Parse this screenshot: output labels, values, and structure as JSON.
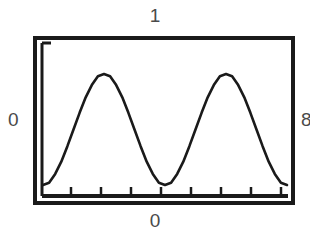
{
  "figure": {
    "name": "sine-wave-plot",
    "background_color": "#ffffff",
    "ink_color": "#1a1a1a",
    "label_color": "#4a4a4a"
  },
  "labels": {
    "top": "1",
    "bottom": "0",
    "left": "0",
    "right": "8"
  },
  "chart_data": {
    "type": "line",
    "title": "",
    "subtitle": "",
    "xlabel": "0",
    "ylabel": "0",
    "top_label": "1",
    "right_label": "8",
    "grid": false,
    "legend": null,
    "axis": {
      "x_ticks_count": 8,
      "x_tick_labels": [],
      "y_ticks_count": 1,
      "y_tick_labels": [],
      "xlim": [
        0,
        2
      ],
      "ylim": [
        0,
        1
      ]
    },
    "series": [
      {
        "name": "sine",
        "description": "two periods of a raised sinusoid",
        "x": [
          0.0,
          0.05,
          0.1,
          0.15,
          0.2,
          0.25,
          0.3,
          0.35,
          0.4,
          0.45,
          0.5,
          0.55,
          0.6,
          0.65,
          0.7,
          0.75,
          0.8,
          0.85,
          0.9,
          0.95,
          1.0,
          1.05,
          1.1,
          1.15,
          1.2,
          1.25,
          1.3,
          1.35,
          1.4,
          1.45,
          1.5,
          1.55,
          1.6,
          1.65,
          1.7,
          1.75,
          1.8,
          1.85,
          1.9,
          1.95,
          2.0
        ],
        "y": [
          0.0,
          0.02,
          0.1,
          0.21,
          0.35,
          0.5,
          0.65,
          0.79,
          0.9,
          0.98,
          1.0,
          0.98,
          0.9,
          0.79,
          0.65,
          0.5,
          0.35,
          0.21,
          0.1,
          0.02,
          0.0,
          0.02,
          0.1,
          0.21,
          0.35,
          0.5,
          0.65,
          0.79,
          0.9,
          0.98,
          1.0,
          0.98,
          0.9,
          0.79,
          0.65,
          0.5,
          0.35,
          0.21,
          0.1,
          0.02,
          0.0
        ]
      }
    ],
    "annotations": {
      "peaks": [
        {
          "x": 0.5,
          "y": 1.0
        },
        {
          "x": 1.5,
          "y": 1.0
        }
      ],
      "troughs": [
        {
          "x": 0.0,
          "y": 0.0
        },
        {
          "x": 1.0,
          "y": 0.0
        },
        {
          "x": 2.0,
          "y": 0.0
        }
      ]
    }
  }
}
